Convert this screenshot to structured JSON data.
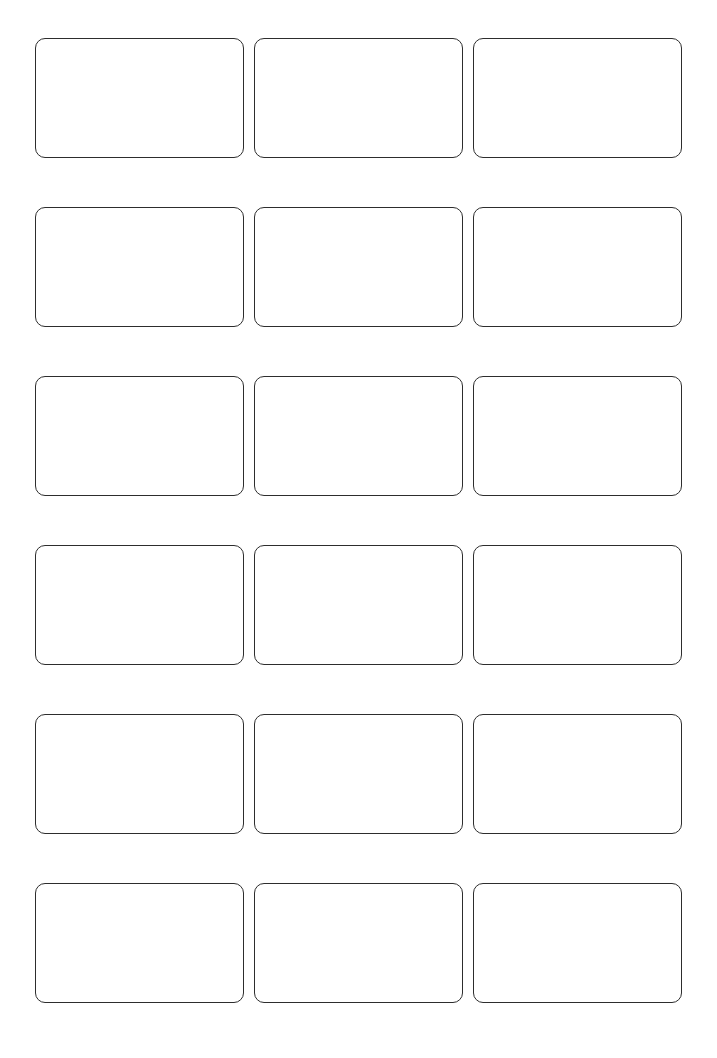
{
  "page": {
    "kind": "blank-label-sheet",
    "title": "",
    "background_color": "#ffffff",
    "width": 717,
    "height": 1058
  },
  "grid": {
    "rows": 6,
    "columns": 3,
    "total_cells": 18,
    "margin_left": 35,
    "margin_top": 38,
    "margin_right": 35,
    "margin_bottom": 53,
    "cell_width": 209,
    "cell_height": 120,
    "column_gap": 10,
    "row_gap": 49
  },
  "card_style": {
    "border_color": "#2d2d2d",
    "border_width": 1.4,
    "corner_radius": 10,
    "fill_color": "#ffffff"
  },
  "labels": [
    {
      "id": "label-r1c1",
      "row": 1,
      "column": 1,
      "text": ""
    },
    {
      "id": "label-r1c2",
      "row": 1,
      "column": 2,
      "text": ""
    },
    {
      "id": "label-r1c3",
      "row": 1,
      "column": 3,
      "text": ""
    },
    {
      "id": "label-r2c1",
      "row": 2,
      "column": 1,
      "text": ""
    },
    {
      "id": "label-r2c2",
      "row": 2,
      "column": 2,
      "text": ""
    },
    {
      "id": "label-r2c3",
      "row": 2,
      "column": 3,
      "text": ""
    },
    {
      "id": "label-r3c1",
      "row": 3,
      "column": 1,
      "text": ""
    },
    {
      "id": "label-r3c2",
      "row": 3,
      "column": 2,
      "text": ""
    },
    {
      "id": "label-r3c3",
      "row": 3,
      "column": 3,
      "text": ""
    },
    {
      "id": "label-r4c1",
      "row": 4,
      "column": 1,
      "text": ""
    },
    {
      "id": "label-r4c2",
      "row": 4,
      "column": 2,
      "text": ""
    },
    {
      "id": "label-r4c3",
      "row": 4,
      "column": 3,
      "text": ""
    },
    {
      "id": "label-r5c1",
      "row": 5,
      "column": 1,
      "text": ""
    },
    {
      "id": "label-r5c2",
      "row": 5,
      "column": 2,
      "text": ""
    },
    {
      "id": "label-r5c3",
      "row": 5,
      "column": 3,
      "text": ""
    },
    {
      "id": "label-r6c1",
      "row": 6,
      "column": 1,
      "text": ""
    },
    {
      "id": "label-r6c2",
      "row": 6,
      "column": 2,
      "text": ""
    },
    {
      "id": "label-r6c3",
      "row": 6,
      "column": 3,
      "text": ""
    }
  ]
}
